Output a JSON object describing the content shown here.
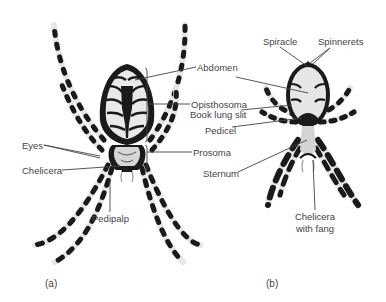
{
  "figure": {
    "panels": [
      {
        "id": "a",
        "label": "(a)",
        "view": "dorsal",
        "annotations": {
          "abdomen": "Abdomen",
          "opisthosoma": "Opisthosoma",
          "prosoma": "Prosoma",
          "eyes": "Eyes",
          "chelicera": "Chelicera",
          "pedipalp": "Pedipalp"
        }
      },
      {
        "id": "b",
        "label": "(b)",
        "view": "ventral",
        "annotations": {
          "spiracle": "Spiracle",
          "spinnerets": "Spinnerets",
          "book_lung_slit": "Book lung slit",
          "pedicel": "Pedicel",
          "sternum": "Sternum",
          "chelicera_with_fang_line1": "Chelicera",
          "chelicera_with_fang_line2": "with fang"
        }
      }
    ],
    "colors": {
      "ink": "#1a1a1a",
      "body_light": "#e9e9e9",
      "leader_line": "#444444",
      "text": "#444444"
    }
  }
}
